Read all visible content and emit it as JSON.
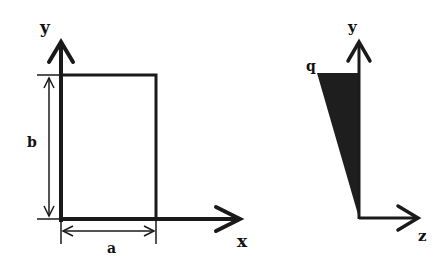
{
  "figure_left": {
    "description": "Rectangular plate in x-y plane with dimensions a by b",
    "axis_x_label": "x",
    "axis_y_label": "y",
    "dim_width_label": "a",
    "dim_height_label": "b"
  },
  "figure_right": {
    "description": "Triangular (linearly varying) load distribution along y in y-z plane",
    "axis_y_label": "y",
    "axis_z_label": "z",
    "load_label": "q"
  },
  "colors": {
    "line": "#1a1a1a",
    "fill": "#1e1e1e",
    "background": "#ffffff"
  }
}
